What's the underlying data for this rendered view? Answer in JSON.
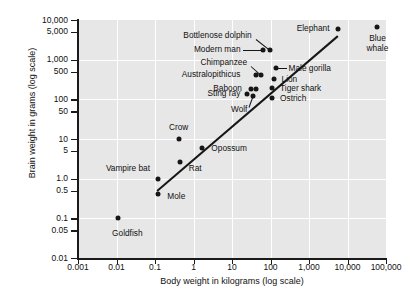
{
  "chart_data": {
    "type": "scatter",
    "title": "",
    "xlabel": "Body weight in kilograms (log scale)",
    "ylabel": "Brain weight in grams (log scale)",
    "xscale": "log",
    "yscale": "log",
    "xlim": [
      0.001,
      100000
    ],
    "ylim": [
      0.01,
      10000
    ],
    "grid": true,
    "legend": "none",
    "xticks": [
      "0.001",
      "0.01",
      "0.1",
      "1",
      "10",
      "100",
      "1,000",
      "10,000",
      "100,000"
    ],
    "xtick_values": [
      0.001,
      0.01,
      0.1,
      1,
      10,
      100,
      1000,
      10000,
      100000
    ],
    "yticks": [
      "10,000",
      "5,000",
      "1,000",
      "500",
      "100",
      "50",
      "10",
      "5",
      "1.0",
      "0.5",
      "0.1",
      "0.05",
      "0.01"
    ],
    "ytick_values": [
      10000,
      5000,
      1000,
      500,
      100,
      50,
      10,
      5,
      1.0,
      0.5,
      0.1,
      0.05,
      0.01
    ],
    "points": [
      {
        "name": "Goldfish",
        "x": 0.011,
        "y": 0.1,
        "label_pos": "below-left"
      },
      {
        "name": "Mole",
        "x": 0.122,
        "y": 0.42,
        "label_pos": "right"
      },
      {
        "name": "Vampire bat",
        "x": 0.12,
        "y": 1.0,
        "label_pos": "left"
      },
      {
        "name": "Rat",
        "x": 0.44,
        "y": 2.6,
        "label_pos": "right"
      },
      {
        "name": "Crow",
        "x": 0.41,
        "y": 10.0,
        "label_pos": "above"
      },
      {
        "name": "Opossum",
        "x": 1.7,
        "y": 6.0,
        "label_pos": "right"
      },
      {
        "name": "Wolf",
        "x": 36.0,
        "y": 120.0,
        "label_pos": "below-left"
      },
      {
        "name": "Sting ray",
        "x": 25.0,
        "y": 135.0,
        "label_pos": "left"
      },
      {
        "name": "Baboon",
        "x": 31.0,
        "y": 180.0,
        "label_pos": "left"
      },
      {
        "name": "Baboon-2",
        "x": 41.0,
        "y": 180.0,
        "label_pos": "none"
      },
      {
        "name": "Australopithicus",
        "x": 43.0,
        "y": 420.0,
        "label_pos": "left"
      },
      {
        "name": "Chimpanzee",
        "x": 57.0,
        "y": 420.0,
        "label_pos": "above-left"
      },
      {
        "name": "Ostrich",
        "x": 110.0,
        "y": 110.0,
        "label_pos": "right"
      },
      {
        "name": "Tiger shark",
        "x": 110.0,
        "y": 190.0,
        "label_pos": "right"
      },
      {
        "name": "Lion",
        "x": 120.0,
        "y": 330.0,
        "label_pos": "right"
      },
      {
        "name": "Male gorilla",
        "x": 135.0,
        "y": 600.0,
        "label_pos": "right"
      },
      {
        "name": "Modern man",
        "x": 62.0,
        "y": 1800.0,
        "label_pos": "left"
      },
      {
        "name": "Bottlenose dolphin",
        "x": 95.0,
        "y": 1800.0,
        "label_pos": "above-left"
      },
      {
        "name": "Elephant",
        "x": 5500.0,
        "y": 6000.0,
        "label_pos": "left"
      },
      {
        "name": "Blue whale",
        "x": 60000.0,
        "y": 6500.0,
        "label_pos": "below"
      }
    ],
    "trend_line": {
      "x0": 0.11,
      "y0": 0.52,
      "x1": 5500.0,
      "y1": 4200.0
    }
  }
}
